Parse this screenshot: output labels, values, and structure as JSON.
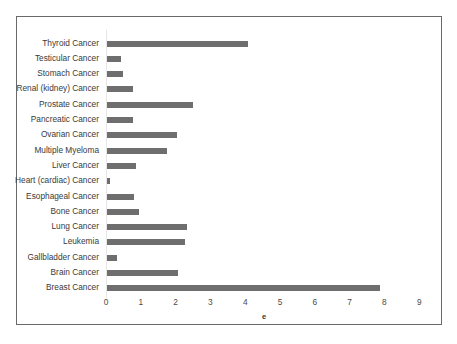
{
  "chart_data": {
    "type": "bar",
    "orientation": "horizontal",
    "title": "",
    "xlabel": "e",
    "ylabel": "",
    "xlim": [
      0,
      9
    ],
    "xticks": [
      0,
      1,
      2,
      3,
      4,
      5,
      6,
      7,
      8,
      9
    ],
    "grid": false,
    "legend": null,
    "bar_color": "#6e6e6e",
    "categories": [
      "Thyroid Cancer",
      "Testicular Cancer",
      "Stomach Cancer",
      "Renal (kidney) Cancer",
      "Prostate Cancer",
      "Pancreatic Cancer",
      "Ovarian Cancer",
      "Multiple Myeloma",
      "Liver Cancer",
      "Heart (cardiac) Cancer",
      "Esophageal Cancer",
      "Bone Cancer",
      "Lung Cancer",
      "Leukemia",
      "Gallbladder Cancer",
      "Brain Cancer",
      "Breast Cancer"
    ],
    "values": [
      4.05,
      0.4,
      0.46,
      0.75,
      2.47,
      0.75,
      2.0,
      1.73,
      0.83,
      0.1,
      0.77,
      0.92,
      2.3,
      2.25,
      0.3,
      2.03,
      7.85
    ]
  }
}
